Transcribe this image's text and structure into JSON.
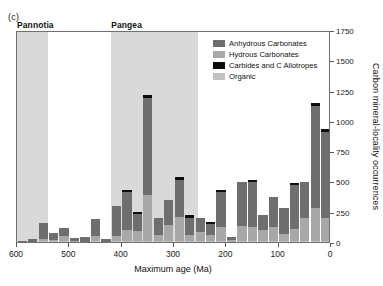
{
  "panel": {
    "label": "(c)"
  },
  "supercontinents": [
    {
      "name": "Pannotia",
      "start_ma": 600,
      "end_ma": 540
    },
    {
      "name": "Pangea",
      "start_ma": 420,
      "end_ma": 255
    }
  ],
  "legend": {
    "items": [
      {
        "label": "Anhydrous Carbonates",
        "color": "#6e6e6e"
      },
      {
        "label": "Hydrous Carbonates",
        "color": "#a8a8a8"
      },
      {
        "label": "Carbides and C Allotropes",
        "color": "#0d0d0d"
      },
      {
        "label": "Organic",
        "color": "#c2c2c2"
      }
    ]
  },
  "chart_data": {
    "type": "bar",
    "stacked": true,
    "title": "",
    "xlabel": "Maximum age (Ma)",
    "ylabel": "Carbon mineral-locality occurrences",
    "xlim": [
      600,
      0
    ],
    "xticks": [
      600,
      500,
      400,
      300,
      200,
      100,
      0
    ],
    "ylim": [
      0,
      1750
    ],
    "yticks": [
      0,
      250,
      500,
      750,
      1000,
      1250,
      1500,
      1750
    ],
    "grid": false,
    "legend_position": "top-right",
    "bin_width_ma": 20,
    "categories": [
      600,
      580,
      560,
      540,
      520,
      500,
      480,
      460,
      440,
      420,
      400,
      380,
      360,
      340,
      320,
      300,
      280,
      260,
      240,
      220,
      200,
      180,
      160,
      140,
      120,
      100,
      80,
      60,
      40,
      20
    ],
    "series": [
      {
        "name": "Anhydrous Carbonates",
        "color": "#6e6e6e",
        "values": [
          10,
          25,
          130,
          55,
          60,
          25,
          35,
          140,
          20,
          250,
          310,
          145,
          800,
          140,
          210,
          310,
          140,
          115,
          90,
          285,
          30,
          360,
          370,
          125,
          245,
          215,
          365,
          300,
          845,
          710
        ]
      },
      {
        "name": "Hydrous Carbonates",
        "color": "#a8a8a8",
        "values": [
          0,
          0,
          20,
          15,
          45,
          5,
          0,
          45,
          0,
          40,
          90,
          80,
          380,
          50,
          130,
          195,
          50,
          75,
          55,
          120,
          10,
          125,
          115,
          90,
          120,
          60,
          100,
          190,
          265,
          190
        ]
      },
      {
        "name": "Carbides and C Allotropes",
        "color": "#0d0d0d",
        "values": [
          0,
          0,
          0,
          0,
          0,
          0,
          0,
          0,
          0,
          0,
          18,
          18,
          25,
          0,
          0,
          18,
          22,
          0,
          14,
          14,
          0,
          0,
          18,
          0,
          0,
          0,
          18,
          0,
          22,
          22
        ]
      },
      {
        "name": "Organic",
        "color": "#c2c2c2",
        "values": [
          0,
          0,
          5,
          5,
          8,
          4,
          4,
          6,
          4,
          10,
          10,
          8,
          10,
          6,
          8,
          10,
          8,
          6,
          6,
          8,
          4,
          8,
          8,
          6,
          8,
          6,
          8,
          8,
          12,
          10
        ]
      }
    ]
  }
}
